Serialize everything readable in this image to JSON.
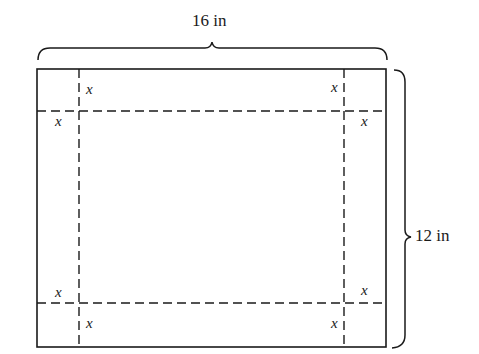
{
  "diagram": {
    "type": "sheet-with-cut-corners",
    "width_label": "16 in",
    "height_label": "12 in",
    "corner_label": "x",
    "corner_labels": [
      {
        "position": "top-left-vertical",
        "text": "x"
      },
      {
        "position": "top-left-horizontal",
        "text": "x"
      },
      {
        "position": "top-right-vertical",
        "text": "x"
      },
      {
        "position": "top-right-horizontal",
        "text": "x"
      },
      {
        "position": "bottom-left-horizontal",
        "text": "x"
      },
      {
        "position": "bottom-left-vertical",
        "text": "x"
      },
      {
        "position": "bottom-right-horizontal",
        "text": "x"
      },
      {
        "position": "bottom-right-vertical",
        "text": "x"
      }
    ],
    "colors": {
      "line": "#1a1a1a",
      "background": "#ffffff"
    }
  }
}
